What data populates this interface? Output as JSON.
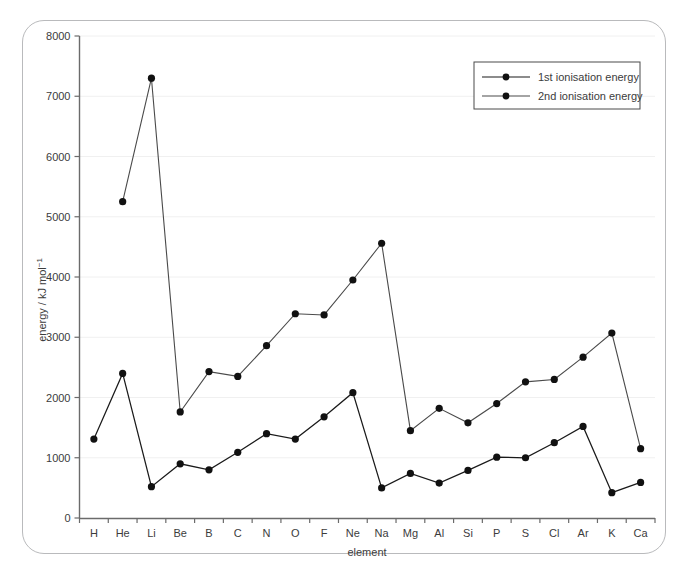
{
  "chart_data": {
    "type": "line",
    "title": "",
    "xlabel": "element",
    "ylabel": "energy / kJ mol",
    "ylabel_sup": "−1",
    "ylabel_full": "energy / kJ mol⁻¹",
    "categories": [
      "H",
      "He",
      "Li",
      "Be",
      "B",
      "C",
      "N",
      "O",
      "F",
      "Ne",
      "Na",
      "Mg",
      "Al",
      "Si",
      "P",
      "S",
      "Cl",
      "Ar",
      "K",
      "Ca"
    ],
    "ylim": [
      0,
      8000
    ],
    "yticks": [
      0,
      1000,
      2000,
      3000,
      4000,
      5000,
      6000,
      7000,
      8000
    ],
    "ytick_labels": [
      "0",
      "1000",
      "2000",
      "3000",
      "4000",
      "5000",
      "6000",
      "7000",
      "8000"
    ],
    "grid": true,
    "grid_axis": "y",
    "legend_position": "top-right",
    "marker": "filled-circle",
    "series": [
      {
        "name": "1st ionisation energy",
        "color": "#1a1a1a",
        "values": [
          1310,
          2400,
          520,
          900,
          800,
          1090,
          1400,
          1310,
          1680,
          2080,
          500,
          740,
          580,
          790,
          1010,
          1000,
          1250,
          1520,
          420,
          590
        ]
      },
      {
        "name": "2nd ionisation energy",
        "color": "#4a4a4a",
        "values": [
          null,
          5250,
          7300,
          1760,
          2430,
          2350,
          2860,
          3390,
          3370,
          3950,
          4560,
          1450,
          1820,
          1580,
          1900,
          2260,
          2300,
          2670,
          3070,
          1150
        ]
      }
    ]
  },
  "legend": {
    "entries": [
      {
        "label": "1st ionisation energy"
      },
      {
        "label": "2nd ionisation energy"
      }
    ]
  },
  "colors": {
    "series1": "#1a1a1a",
    "series2": "#4a4a4a",
    "axis": "#6b6b6b",
    "grid": "#f0f0f0",
    "text": "#3c3c3c",
    "card_border": "#b9babc",
    "background": "#ffffff"
  }
}
